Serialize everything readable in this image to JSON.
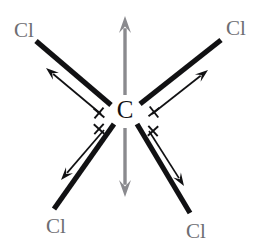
{
  "diagram": {
    "molecule_formula": "CCl4",
    "center_atom": {
      "symbol": "C",
      "name": "carbon",
      "x": 125,
      "y": 112,
      "color": "#121214"
    },
    "terminal_atoms": [
      {
        "symbol": "Cl",
        "name": "chlorine-top-left",
        "x": 24,
        "y": 32,
        "color": "#6e6e72"
      },
      {
        "symbol": "Cl",
        "name": "chlorine-top-right",
        "x": 236,
        "y": 30,
        "color": "#6e6e72"
      },
      {
        "symbol": "Cl",
        "name": "chlorine-bottom-left",
        "x": 56,
        "y": 228,
        "color": "#6e6e72"
      },
      {
        "symbol": "Cl",
        "name": "chlorine-bottom-right",
        "x": 196,
        "y": 233,
        "color": "#6e6e72"
      }
    ],
    "bonds": [
      {
        "name": "bond-top-left",
        "x1": 111,
        "y1": 105,
        "x2": 36,
        "y2": 41,
        "color": "#111113",
        "width": 5.2
      },
      {
        "name": "bond-top-right",
        "x1": 140,
        "y1": 104,
        "x2": 221,
        "y2": 40,
        "color": "#111113",
        "width": 5.2
      },
      {
        "name": "bond-bottom-left",
        "x1": 114,
        "y1": 124,
        "x2": 54,
        "y2": 209,
        "color": "#111113",
        "width": 5.2
      },
      {
        "name": "bond-bottom-right",
        "x1": 137,
        "y1": 124,
        "x2": 190,
        "y2": 213,
        "color": "#111113",
        "width": 5.2
      }
    ],
    "bond_dipoles": [
      {
        "name": "dipole-top-left",
        "tail_x": 101,
        "tail_y": 114,
        "head_x": 46,
        "head_y": 68,
        "direction": "toward-chlorine",
        "color": "#111113"
      },
      {
        "name": "dipole-top-right",
        "tail_x": 152,
        "tail_y": 114,
        "head_x": 208,
        "head_y": 70,
        "direction": "toward-chlorine",
        "color": "#111113"
      },
      {
        "name": "dipole-bottom-left",
        "tail_x": 104,
        "tail_y": 130,
        "head_x": 61,
        "head_y": 180,
        "direction": "toward-chlorine",
        "color": "#111113"
      },
      {
        "name": "dipole-bottom-right",
        "tail_x": 149,
        "tail_y": 131,
        "head_x": 184,
        "head_y": 186,
        "direction": "toward-chlorine",
        "color": "#111113"
      }
    ],
    "cross_marks": [
      {
        "name": "cross-mark-top-left",
        "x": 99,
        "y": 113,
        "angle": 40
      },
      {
        "name": "cross-mark-top-right",
        "x": 154,
        "y": 112,
        "angle": -38
      },
      {
        "name": "cross-mark-bottom-left",
        "x": 99,
        "y": 129,
        "angle": -48
      },
      {
        "name": "cross-mark-bottom-right",
        "x": 153,
        "y": 131,
        "angle": 48
      }
    ],
    "net_arrows": [
      {
        "name": "net-arrow-up",
        "tail_x": 125,
        "tail_y": 95,
        "head_x": 125,
        "head_y": 16,
        "color": "#8a8a8e"
      },
      {
        "name": "net-arrow-down",
        "tail_x": 125,
        "tail_y": 128,
        "head_x": 125,
        "head_y": 197,
        "color": "#8a8a8e"
      }
    ],
    "colors": {
      "background": "#ffffff",
      "bond": "#111113",
      "dipole": "#111113",
      "terminal_label": "#6e6e72",
      "center_label": "#121214",
      "net_arrow": "#8a8a8e"
    }
  }
}
